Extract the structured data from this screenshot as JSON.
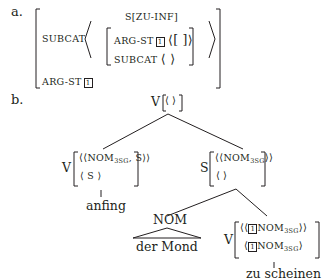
{
  "figure": {
    "part_a": {
      "label": "a.",
      "outer_avm": {
        "features": [
          {
            "attr": "SUBCAT",
            "value_type": "list"
          },
          {
            "attr": "ARG-ST",
            "tag": "1"
          }
        ]
      },
      "inner_category": "S[ZU-INF]",
      "inner_avm": {
        "argst_attr": "ARG-ST",
        "argst_tag": "1",
        "argst_value": "⟨[ ]⟩",
        "subcat_attr": "SUBCAT",
        "subcat_value": "⟨ ⟩"
      }
    },
    "part_b": {
      "label": "b.",
      "root": {
        "cat": "V",
        "value": "⟨ ⟩"
      },
      "left_node": {
        "cat": "V",
        "row1_pre": "⟨⟨",
        "row1_nom": "NOM",
        "row1_sub": "3SG",
        "row1_post": ", S⟩⟩",
        "row2": "⟨ S ⟩",
        "word": "anfing"
      },
      "right_node": {
        "cat": "S",
        "row1_pre": "⟨⟨",
        "row1_nom": "NOM",
        "row1_sub": "3SG",
        "row1_post": "⟩⟩",
        "row2": "⟨ ⟩"
      },
      "nom_node": {
        "cat": "NOM",
        "words": "der Mond"
      },
      "inner_v_node": {
        "cat": "V",
        "row1_pre": "⟨⟨",
        "row1_tag": "1",
        "row1_nom": "NOM",
        "row1_sub": "3SG",
        "row1_post": "⟩⟩",
        "row2_pre": "⟨",
        "row2_tag": "1",
        "row2_nom": "NOM",
        "row2_sub": "3SG",
        "row2_post": "⟩",
        "word": "zu scheinen"
      }
    }
  }
}
